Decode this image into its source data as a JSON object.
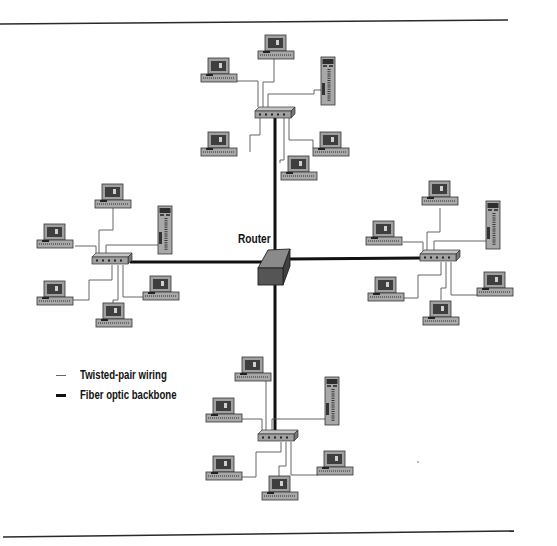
{
  "diagram": {
    "type": "network-topology",
    "center_node": {
      "label": "Router",
      "icon": "router-icon"
    },
    "segments": [
      {
        "position": "top",
        "hub": "hub-icon",
        "workstations": 5,
        "servers": 1
      },
      {
        "position": "left",
        "hub": "hub-icon",
        "workstations": 5,
        "servers": 1
      },
      {
        "position": "right",
        "hub": "hub-icon",
        "workstations": 5,
        "servers": 1
      },
      {
        "position": "bottom",
        "hub": "hub-icon",
        "workstations": 5,
        "servers": 1
      }
    ]
  },
  "legend": {
    "items": [
      {
        "label": "Twisted-pair wiring",
        "line": "thin",
        "color": "#555555"
      },
      {
        "label": "Fiber optic backbone",
        "line": "thick",
        "color": "#111111"
      }
    ]
  },
  "colors": {
    "backbone": "#111111",
    "twisted_pair": "#555555",
    "device_fill": "#9a9a9a",
    "screen_fill": "#4a4a4a",
    "router_top": "#8a8a8a",
    "router_front": "#505050"
  }
}
